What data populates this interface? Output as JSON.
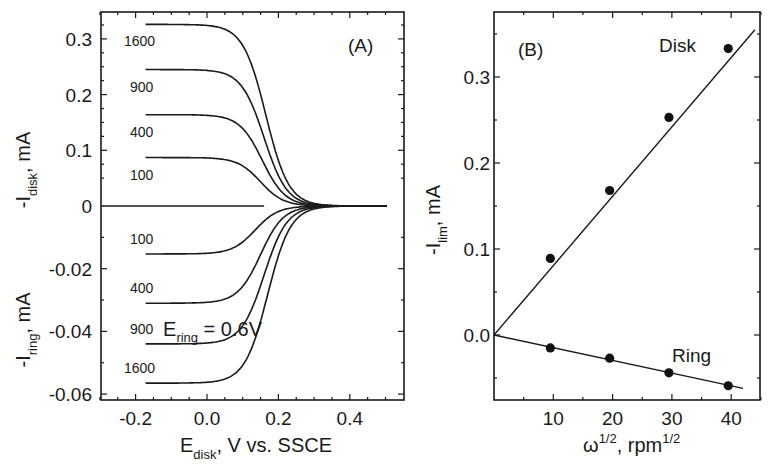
{
  "chart_data": [
    {
      "type": "line",
      "panel": "(A)",
      "xlabel": "E_disk, V vs. SSCE",
      "xlabel_main": "E",
      "xlabel_sub": "disk",
      "xlabel_rest": ", V vs. SSCE",
      "ylabel_top": "-I_disk, mA",
      "ylabel_top_main": "-I",
      "ylabel_top_sub": "disk",
      "ylabel_top_rest": ", mA",
      "ylabel_bottom": "-I_ring, mA",
      "ylabel_bottom_main": "-I",
      "ylabel_bottom_sub": "ring",
      "ylabel_bottom_rest": ", mA",
      "xlim": [
        -0.3,
        0.5
      ],
      "xticks": [
        "-0.2",
        "0.0",
        "0.2",
        "0.4"
      ],
      "xtick_values": [
        -0.2,
        0.0,
        0.2,
        0.4
      ],
      "ylim_disk": [
        0,
        0.35
      ],
      "yticks_disk": [
        "0.3",
        "0.2",
        "0.1",
        "0"
      ],
      "ytick_values_disk": [
        0.3,
        0.2,
        0.1,
        0
      ],
      "ylim_ring": [
        -0.062,
        0
      ],
      "yticks_ring": [
        "-0.02",
        "-0.04",
        "-0.06"
      ],
      "ytick_values_ring": [
        -0.02,
        -0.04,
        -0.06
      ],
      "annotation": "E_ring = 0.6V",
      "annotation_main": "E",
      "annotation_sub": "ring",
      "annotation_rest": " = 0.6V",
      "legend": "curves labeled by rotation rate (rpm)",
      "series": [
        {
          "name": "disk 1600",
          "label": "1600",
          "plateau": 0.326,
          "e_half": 0.165
        },
        {
          "name": "disk 900",
          "label": "900",
          "plateau": 0.245,
          "e_half": 0.16
        },
        {
          "name": "disk 400",
          "label": "400",
          "plateau": 0.164,
          "e_half": 0.155
        },
        {
          "name": "disk 100",
          "label": "100",
          "plateau": 0.087,
          "e_half": 0.15
        },
        {
          "name": "ring 100",
          "label": "100",
          "plateau": -0.0153,
          "e_half": 0.135
        },
        {
          "name": "ring 400",
          "label": "400",
          "plateau": -0.031,
          "e_half": 0.15
        },
        {
          "name": "ring 900",
          "label": "900",
          "plateau": -0.044,
          "e_half": 0.16
        },
        {
          "name": "ring 1600",
          "label": "1600",
          "plateau": -0.0565,
          "e_half": 0.17
        }
      ],
      "x_start": -0.172,
      "x_end": 0.505,
      "zero_line_end": 0.16
    },
    {
      "type": "scatter",
      "panel": "(B)",
      "xlabel": "ω^1/2, rpm^1/2",
      "ylabel": "-I_lim, mA",
      "ylabel_main": "-I",
      "ylabel_sub": "lim",
      "ylabel_rest": ", mA",
      "xlim": [
        0,
        45
      ],
      "ylim": [
        -0.075,
        0.375
      ],
      "xticks": [
        "10",
        "20",
        "30",
        "40"
      ],
      "xtick_values": [
        10,
        20,
        30,
        40
      ],
      "yticks": [
        "0.3",
        "0.2",
        "0.1",
        "0.0"
      ],
      "ytick_values": [
        0.3,
        0.2,
        0.1,
        0.0
      ],
      "series": [
        {
          "name": "Disk",
          "x": [
            9.5,
            19.5,
            29.5,
            39.5
          ],
          "y": [
            0.089,
            0.168,
            0.253,
            0.333
          ],
          "fit_end": [
            44,
            0.355
          ]
        },
        {
          "name": "Ring",
          "x": [
            9.5,
            19.5,
            29.5,
            39.5
          ],
          "y": [
            -0.015,
            -0.027,
            -0.044,
            -0.059
          ],
          "fit_end": [
            42,
            -0.062
          ]
        }
      ]
    }
  ],
  "labels": {
    "panel_a": "(A)",
    "panel_b": "(B)",
    "disk": "Disk",
    "ring": "Ring",
    "omega": "ω",
    "half": "1/2",
    "rpm": ", rpm",
    "rpm_half": "1/2"
  }
}
